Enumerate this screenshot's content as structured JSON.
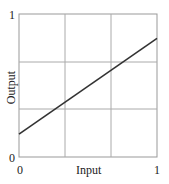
{
  "chart_data": {
    "type": "line",
    "title": "",
    "xlabel": "Input",
    "ylabel": "Output",
    "xlim": [
      0,
      1
    ],
    "ylim": [
      0,
      1
    ],
    "grid": true,
    "grid_divisions": 3,
    "x_tick_labels": [
      "0",
      "1"
    ],
    "y_tick_labels": [
      "0",
      "1"
    ],
    "series": [
      {
        "name": "Output",
        "x": [
          0,
          1
        ],
        "y": [
          0.16,
          0.83
        ]
      }
    ],
    "colors": {
      "line": "#333333",
      "grid": "#aaaaaa",
      "frame": "#999999"
    }
  }
}
